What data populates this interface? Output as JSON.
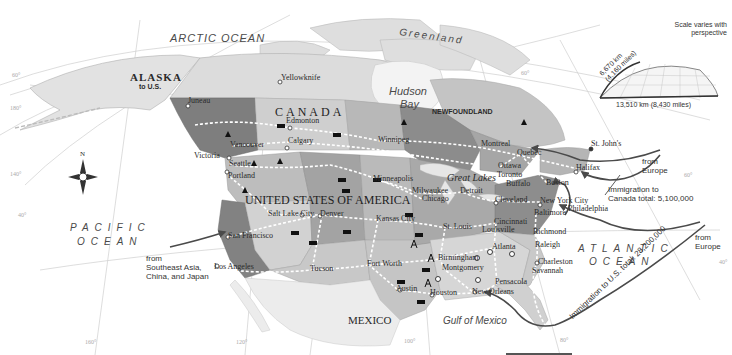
{
  "map": {
    "title": "Immigration to North America",
    "oceans": {
      "arctic": "ARCTIC OCEAN",
      "pacific_line1": "PACIFIC",
      "pacific_line2": "OCEAN",
      "atlantic_line1": "ATLANTIC",
      "atlantic_line2": "OCEAN",
      "gulf": "Gulf of Mexico"
    },
    "regions": {
      "greenland": "Greenland",
      "hudson_bay_line1": "Hudson",
      "hudson_bay_line2": "Bay",
      "newfoundland": "NEWFOUNDLAND",
      "alaska_line1": "ALASKA",
      "alaska_line2": "to U.S.",
      "canada": "CANADA",
      "usa": "UNITED STATES OF AMERICA",
      "mexico": "MEXICO",
      "great_lakes": "Great Lakes"
    },
    "cities": [
      {
        "name": "Yellowknife",
        "x": 283,
        "y": 79
      },
      {
        "name": "Juneau",
        "x": 190,
        "y": 102
      },
      {
        "name": "Edmonton",
        "x": 288,
        "y": 122
      },
      {
        "name": "Calgary",
        "x": 290,
        "y": 142
      },
      {
        "name": "Vancouver",
        "x": 232,
        "y": 146
      },
      {
        "name": "Victoria",
        "x": 196,
        "y": 157
      },
      {
        "name": "Seattle",
        "x": 231,
        "y": 165
      },
      {
        "name": "Portland",
        "x": 230,
        "y": 177
      },
      {
        "name": "Winnipeg",
        "x": 380,
        "y": 141
      },
      {
        "name": "Montreal",
        "x": 483,
        "y": 145
      },
      {
        "name": "Quebec",
        "x": 519,
        "y": 154
      },
      {
        "name": "Ottawa",
        "x": 500,
        "y": 167
      },
      {
        "name": "Toronto",
        "x": 499,
        "y": 176
      },
      {
        "name": "Buffalo",
        "x": 508,
        "y": 185
      },
      {
        "name": "St. John's",
        "x": 593,
        "y": 145
      },
      {
        "name": "Halifax",
        "x": 578,
        "y": 169
      },
      {
        "name": "Boston",
        "x": 548,
        "y": 184
      },
      {
        "name": "New York City",
        "x": 542,
        "y": 202
      },
      {
        "name": "Philadelphia",
        "x": 570,
        "y": 210
      },
      {
        "name": "Baltimore",
        "x": 536,
        "y": 214
      },
      {
        "name": "Minneapolis",
        "x": 375,
        "y": 180
      },
      {
        "name": "Milwaukee",
        "x": 414,
        "y": 192
      },
      {
        "name": "Detroit",
        "x": 462,
        "y": 192
      },
      {
        "name": "Chicago",
        "x": 424,
        "y": 200
      },
      {
        "name": "Cleveland",
        "x": 497,
        "y": 201
      },
      {
        "name": "Salt Lake City",
        "x": 270,
        "y": 215
      },
      {
        "name": "Denver",
        "x": 322,
        "y": 215
      },
      {
        "name": "Kansas City",
        "x": 378,
        "y": 220
      },
      {
        "name": "St. Louis",
        "x": 445,
        "y": 228
      },
      {
        "name": "Cincinnati",
        "x": 496,
        "y": 223
      },
      {
        "name": "Louisville",
        "x": 484,
        "y": 231
      },
      {
        "name": "Richmond",
        "x": 535,
        "y": 233
      },
      {
        "name": "Raleigh",
        "x": 537,
        "y": 246
      },
      {
        "name": "Atlanta",
        "x": 494,
        "y": 248
      },
      {
        "name": "Charleston",
        "x": 540,
        "y": 263
      },
      {
        "name": "Savannah",
        "x": 534,
        "y": 272
      },
      {
        "name": "Birmingham",
        "x": 440,
        "y": 259
      },
      {
        "name": "Montgomery",
        "x": 444,
        "y": 269
      },
      {
        "name": "Pensacola",
        "x": 497,
        "y": 283
      },
      {
        "name": "New Orleans",
        "x": 474,
        "y": 293
      },
      {
        "name": "Houston",
        "x": 432,
        "y": 294
      },
      {
        "name": "Austin",
        "x": 398,
        "y": 290
      },
      {
        "name": "Fort Worth",
        "x": 369,
        "y": 265
      },
      {
        "name": "San Francisco",
        "x": 230,
        "y": 237
      },
      {
        "name": "Los Angeles",
        "x": 216,
        "y": 268
      },
      {
        "name": "Tucson",
        "x": 312,
        "y": 270
      }
    ],
    "annotations": {
      "asia_line1": "from",
      "asia_line2": "Southeast Asia,",
      "asia_line3": "China, and Japan",
      "europe_canada_line1": "from",
      "europe_canada_line2": "Europe",
      "canada_total_line1": "Immigration to",
      "canada_total_line2": "Canada total: 5,100,000",
      "europe_us_line1": "from",
      "europe_us_line2": "Europe",
      "us_total": "Immigration to U.S. total: 28,200,000"
    },
    "scale_inset": {
      "note_line1": "Scale varies with",
      "note_line2": "perspective",
      "height_line1": "6,670 km",
      "height_line2": "(4,160 miles)",
      "width": "13,510 km (8,430 miles)"
    },
    "compass": {
      "north": "N"
    },
    "graticule": {
      "lat_60_left": "60°",
      "lon_180": "180°",
      "lon_140": "140°",
      "lat_40_left": "40°",
      "lon_160": "160°",
      "lon_120": "120°",
      "lon_100": "100°",
      "lon_80": "80°",
      "lat_40_right": "40°",
      "lat_60_right": "60°",
      "lon_60": "60°"
    },
    "colors": {
      "water": "#ffffff",
      "land_light": "#d8d8d8",
      "land_mid": "#bcbcbc",
      "land_dark": "#8f8f8f",
      "land_darker": "#7a7a7a",
      "arrow": "#4a4a4a",
      "railroad": "#ffffff"
    }
  }
}
